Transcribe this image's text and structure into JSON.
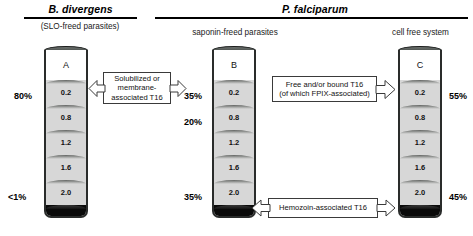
{
  "figure": {
    "title_left": "B. divergens",
    "title_right": "P. falciparum",
    "subhead_a": "(SLO-freed parasites)",
    "subhead_b": "saponin-freed parasites",
    "subhead_c": "cell free system"
  },
  "tubes": [
    {
      "id": "tube-a",
      "letter": "A",
      "bands": [
        "0.2",
        "0.8",
        "1.2",
        "1.6",
        "2.0"
      ],
      "percent_top": "80%",
      "percent_bottom": "<1%",
      "percent_top_side": "left",
      "percent_bottom_side": "left"
    },
    {
      "id": "tube-b",
      "letter": "B",
      "bands": [
        "0.2",
        "0.8",
        "1.2",
        "1.6",
        "2.0"
      ],
      "percent_top": "35%",
      "percent_mid": "20%",
      "percent_bottom": "35%",
      "percent_top_side": "left",
      "percent_bottom_side": "left"
    },
    {
      "id": "tube-c",
      "letter": "C",
      "bands": [
        "0.2",
        "0.8",
        "1.2",
        "1.6",
        "2.0"
      ],
      "percent_top": "55%",
      "percent_bottom": "45%",
      "percent_top_side": "right",
      "percent_bottom_side": "right"
    }
  ],
  "callouts": {
    "left": {
      "line1": "Solubilized or",
      "line2": "membrane-",
      "line3": "associated T16",
      "arrows": "double"
    },
    "right": {
      "line1": "Free and/or bound T16",
      "line2": "(of which FPIX-associated)",
      "arrows": "right"
    },
    "bottom": {
      "line1": "Hemozoin-associated T16",
      "arrows": "double"
    }
  },
  "colors": {
    "band_grey": "#d7d7d7",
    "pellet": "#0a0a0a",
    "tube_outline": "#2a2c2b",
    "cap": "#555a57",
    "text": "#111111",
    "background": "#ffffff"
  }
}
